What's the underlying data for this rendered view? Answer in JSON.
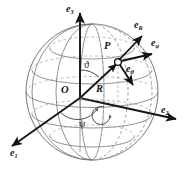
{
  "figure": {
    "type": "geometry-diagram",
    "background_color": "#ffffff",
    "line_color": "#6e6e6e",
    "bold_line_color": "#141414",
    "hidden_line_color": "#9a9a9a"
  },
  "sphere": {
    "center_x": 92,
    "center_y": 92,
    "radius_x": 66,
    "radius_y": 68,
    "latitude_count": 5,
    "longitude_count": 6,
    "outline_color": "#707070"
  },
  "axes": [
    {
      "id": "e3",
      "base": "e",
      "subscript": "3",
      "label_x": 68,
      "label_y": 6,
      "tip_x": 92,
      "tip_y": 11,
      "direction": "up",
      "description": "vertical polar axis"
    },
    {
      "id": "e2",
      "base": "e",
      "subscript": "2",
      "label_x": 163,
      "label_y": 110,
      "tip_x": 178,
      "tip_y": 120,
      "direction": "lower-right",
      "description": "horizontal axis toward right"
    },
    {
      "id": "e1",
      "base": "e",
      "subscript": "1",
      "label_x": 13,
      "label_y": 152,
      "tip_x": 10,
      "tip_y": 147,
      "direction": "lower-left",
      "description": "horizontal axis toward front-left"
    }
  ],
  "point": {
    "id": "P",
    "label": "P",
    "label_x": 106,
    "label_y": 44,
    "marker_x": 118,
    "marker_y": 62,
    "marker_style": "open-circle"
  },
  "origin": {
    "label": "O",
    "label_x": 62,
    "label_y": 84,
    "x": 80,
    "y": 98
  },
  "radius": {
    "label": "R",
    "label_x": 97,
    "label_y": 83,
    "from_x": 80,
    "from_y": 98,
    "to_x": 118,
    "to_y": 62
  },
  "unit_vectors": [
    {
      "id": "eR",
      "base": "e",
      "subscript": "R",
      "label_x": 136,
      "label_y": 24,
      "tip_x": 141,
      "tip_y": 36,
      "description": "radial unit vector outward from sphere"
    },
    {
      "id": "ephi",
      "base": "e",
      "subscript": "φ",
      "label_x": 152,
      "label_y": 42,
      "tip_x": 152,
      "tip_y": 55,
      "description": "azimuthal unit vector"
    },
    {
      "id": "etheta",
      "base": "e",
      "subscript": "ϑ",
      "label_x": 128,
      "label_y": 68,
      "tip_x": 133,
      "tip_y": 86,
      "description": "polar unit vector tangent to meridian"
    }
  ],
  "angles": [
    {
      "id": "theta",
      "symbol": "ϑ",
      "label_x": 85,
      "label_y": 61,
      "between": "e3 axis and R",
      "arc_radius": 26
    },
    {
      "id": "psi",
      "symbol": "ψ",
      "label_x": 81,
      "label_y": 122,
      "between": "e1 axis and equatorial projection of R",
      "arc_radius": 22
    }
  ],
  "annotations": {
    "rotation_marker": "curved arrow in equatorial plane indicating azimuth sweep"
  }
}
